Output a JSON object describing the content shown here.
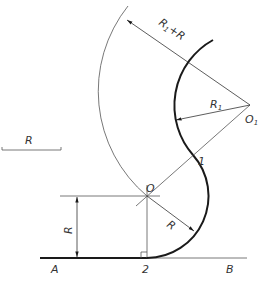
{
  "diagram": {
    "colors": {
      "line": "#555555",
      "thick": "#1a1a1a",
      "text": "#333333",
      "background": "#ffffff"
    },
    "points": {
      "O": {
        "label": "O",
        "x": 147,
        "y": 196
      },
      "O1": {
        "label": "O1",
        "x": 250,
        "y": 105
      },
      "P1": {
        "label": "1",
        "x": 193,
        "y": 155
      },
      "P2": {
        "label": "2",
        "x": 147,
        "y": 258
      },
      "A": {
        "label": "A"
      },
      "B": {
        "label": "B"
      }
    },
    "labels": {
      "A": "A",
      "B": "B",
      "two": "2",
      "one": "1",
      "O": "O",
      "O1_main": "O",
      "O1_sub": "1",
      "R_legend": "R",
      "R_vertical": "R",
      "R_arc": "R",
      "R1_main": "R",
      "R1_sub": "1",
      "R1R_main": "R",
      "R1R_sub": "1",
      "R1R_suffix": "+R"
    },
    "dimensions": {
      "R": 62,
      "R1": 75,
      "R1_plus_R": 137
    }
  }
}
